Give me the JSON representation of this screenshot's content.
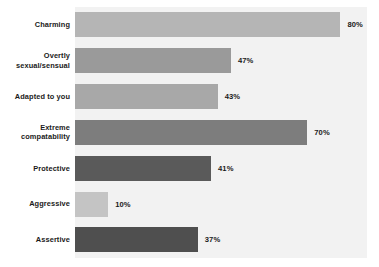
{
  "chart_data": {
    "type": "bar",
    "orientation": "horizontal",
    "title": "",
    "subtitle": "",
    "xlabel": "",
    "ylabel": "",
    "xlim": [
      0,
      88
    ],
    "grid": false,
    "legend": "none",
    "value_suffix": "%",
    "categories": [
      "Charming",
      "Overtly sexual/sensual",
      "Adapted to you",
      "Extreme compatability",
      "Protective",
      "Aggressive",
      "Assertive"
    ],
    "values": [
      80,
      47,
      43,
      70,
      41,
      10,
      37
    ],
    "value_labels": [
      "80%",
      "47%",
      "43%",
      "70%",
      "41%",
      "10%",
      "37%"
    ],
    "bar_colors": [
      "#b5b5b5",
      "#9a9a9a",
      "#a8a8a8",
      "#7d7d7d",
      "#5a5a5a",
      "#c4c4c4",
      "#4f4f4f"
    ],
    "bars": [
      {
        "category": "Charming",
        "category_lines": [
          "Charming"
        ],
        "value": 80,
        "label": "80%",
        "color": "#b5b5b5"
      },
      {
        "category": "Overtly sexual/sensual",
        "category_lines": [
          "Overtly",
          "sexual/sensual"
        ],
        "value": 47,
        "label": "47%",
        "color": "#9a9a9a"
      },
      {
        "category": "Adapted to you",
        "category_lines": [
          "Adapted to you"
        ],
        "value": 43,
        "label": "43%",
        "color": "#a8a8a8"
      },
      {
        "category": "Extreme compatability",
        "category_lines": [
          "Extreme",
          "compatability"
        ],
        "value": 70,
        "label": "70%",
        "color": "#7d7d7d"
      },
      {
        "category": "Protective",
        "category_lines": [
          "Protective"
        ],
        "value": 41,
        "label": "41%",
        "color": "#5a5a5a"
      },
      {
        "category": "Aggressive",
        "category_lines": [
          "Aggressive"
        ],
        "value": 10,
        "label": "10%",
        "color": "#c4c4c4"
      },
      {
        "category": "Assertive",
        "category_lines": [
          "Assertive"
        ],
        "value": 37,
        "label": "37%",
        "color": "#4f4f4f"
      }
    ]
  },
  "style": {
    "page_background": "#ffffff",
    "plot_background": "#f2f2f2",
    "text_color": "#1a1a1a"
  }
}
